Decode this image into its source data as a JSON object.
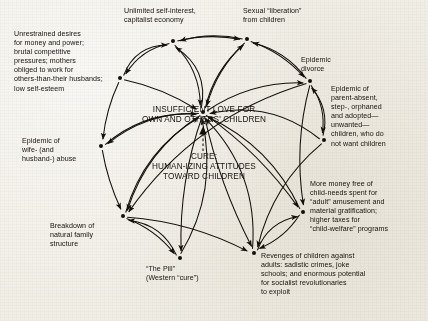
{
  "diagram": {
    "center": {
      "problem_line1": "INSUFFICIENT LOVE FOR",
      "problem_line2": "OWN AND OTHERS' CHILDREN",
      "cure_line1": "CURE:",
      "cure_line2": "HUMAN-IZING ATTITUDES",
      "cure_line3": "TOWARD CHILDREN"
    },
    "nodes": [
      {
        "id": "capitalism",
        "label": "Unlimited self-interest,\ncapitalist economy",
        "dot": [
          173,
          41
        ],
        "text_x": 124,
        "text_y": 7,
        "text_w": 112,
        "align": "left"
      },
      {
        "id": "sexual-liberation",
        "label": "Sexual “liberation”\nfrom children",
        "dot": [
          247,
          39
        ],
        "text_x": 243,
        "text_y": 7,
        "text_w": 92,
        "align": "left"
      },
      {
        "id": "unrestrained-desires",
        "label": "Unrestrained desires\nfor money and power;\nbrutal competitive\npressures; mothers\nobliged to work for\nothers-than-their husbands;\nlow self-esteem",
        "dot": [
          120,
          78
        ],
        "text_x": 14,
        "text_y": 30,
        "text_w": 108,
        "align": "left"
      },
      {
        "id": "epidemic-divorce",
        "label": "Epidemic\ndivorce",
        "dot": [
          310,
          81
        ],
        "text_x": 301,
        "text_y": 56,
        "text_w": 60,
        "align": "left"
      },
      {
        "id": "parent-absent",
        "label": "Epidemic of\nparent-absent,\nstep-, orphaned\nand adopted—\nunwanted—\nchildren, who do\nnot want children",
        "dot": [
          324,
          140
        ],
        "text_x": 331,
        "text_y": 85,
        "text_w": 94,
        "align": "left"
      },
      {
        "id": "wife-abuse",
        "label": "Epidemic of\nwife- (and\nhusband-) abuse",
        "dot": [
          101,
          146
        ],
        "text_x": 22,
        "text_y": 137,
        "text_w": 76,
        "align": "left"
      },
      {
        "id": "more-money",
        "label": "More money free of\nchild-needs spent for\n“adult” amusement and\nmaterial gratification;\nhigher taxes for\n“child-welfare” programs",
        "dot": [
          303,
          212
        ],
        "text_x": 310,
        "text_y": 180,
        "text_w": 118,
        "align": "left"
      },
      {
        "id": "family-breakdown",
        "label": "Breakdown of\nnatural family\nstructure",
        "dot": [
          123,
          216
        ],
        "text_x": 50,
        "text_y": 222,
        "text_w": 72,
        "align": "left"
      },
      {
        "id": "the-pill",
        "label": "“The Pill”\n(Western “cure”)",
        "dot": [
          180,
          258
        ],
        "text_x": 146,
        "text_y": 265,
        "text_w": 80,
        "align": "left"
      },
      {
        "id": "revenges",
        "label": "Revenges of children against\nadults: sadistic crimes, joke\nschools; and enormous potential\nfor socialist revolutionaries\nto exploit",
        "dot": [
          254,
          253
        ],
        "text_x": 261,
        "text_y": 252,
        "text_w": 146,
        "align": "left"
      },
      {
        "id": "insufficient-love",
        "label": "",
        "dot": [
          203,
          112
        ],
        "text_x": 0,
        "text_y": 0,
        "text_w": 0,
        "align": "left"
      }
    ],
    "edges": [
      {
        "from": "capitalism",
        "to": "unrestrained-desires",
        "bow": 14
      },
      {
        "from": "capitalism",
        "to": "insufficient-love",
        "bow": -16
      },
      {
        "from": "sexual-liberation",
        "to": "capitalism",
        "bow": 10
      },
      {
        "from": "insufficient-love",
        "to": "capitalism",
        "bow": 26
      },
      {
        "from": "insufficient-love",
        "to": "sexual-liberation",
        "bow": -14
      },
      {
        "from": "sexual-liberation",
        "to": "insufficient-love",
        "bow": 12
      },
      {
        "from": "sexual-liberation",
        "to": "epidemic-divorce",
        "bow": -10
      },
      {
        "from": "epidemic-divorce",
        "to": "sexual-liberation",
        "bow": 14
      },
      {
        "from": "epidemic-divorce",
        "to": "parent-absent",
        "bow": -12
      },
      {
        "from": "parent-absent",
        "to": "epidemic-divorce",
        "bow": 16
      },
      {
        "from": "insufficient-love",
        "to": "epidemic-divorce",
        "bow": -18
      },
      {
        "from": "unrestrained-desires",
        "to": "wife-abuse",
        "bow": 6
      },
      {
        "from": "unrestrained-desires",
        "to": "insufficient-love",
        "bow": -8
      },
      {
        "from": "insufficient-love",
        "to": "wife-abuse",
        "bow": 20
      },
      {
        "from": "wife-abuse",
        "to": "family-breakdown",
        "bow": 5
      },
      {
        "from": "insufficient-love",
        "to": "family-breakdown",
        "bow": 24
      },
      {
        "from": "epidemic-divorce",
        "to": "family-breakdown",
        "bow": 40
      },
      {
        "from": "family-breakdown",
        "to": "the-pill",
        "bow": -10
      },
      {
        "from": "insufficient-love",
        "to": "the-pill",
        "bow": 14
      },
      {
        "from": "family-breakdown",
        "to": "revenges",
        "bow": -14
      },
      {
        "from": "insufficient-love",
        "to": "revenges",
        "bow": 10
      },
      {
        "from": "parent-absent",
        "to": "revenges",
        "bow": 22
      },
      {
        "from": "insufficient-love",
        "to": "more-money",
        "bow": -12
      },
      {
        "from": "epidemic-divorce",
        "to": "more-money",
        "bow": 14
      },
      {
        "from": "more-money",
        "to": "revenges",
        "bow": -10
      },
      {
        "from": "revenges",
        "to": "more-money",
        "bow": -18
      },
      {
        "from": "the-pill",
        "to": "insufficient-love",
        "bow": 30
      },
      {
        "from": "revenges",
        "to": "insufficient-love",
        "bow": 34
      },
      {
        "from": "parent-absent",
        "to": "insufficient-love",
        "bow": 30
      },
      {
        "from": "family-breakdown",
        "to": "insufficient-love",
        "bow": -26
      },
      {
        "from": "wife-abuse",
        "to": "insufficient-love",
        "bow": -22
      },
      {
        "from": "more-money",
        "to": "insufficient-love",
        "bow": 26
      },
      {
        "from": "capitalism",
        "to": "sexual-liberation",
        "bow": -8
      },
      {
        "from": "unrestrained-desires",
        "to": "capitalism",
        "bow": -22
      },
      {
        "from": "the-pill",
        "to": "family-breakdown",
        "bow": 20
      }
    ]
  }
}
